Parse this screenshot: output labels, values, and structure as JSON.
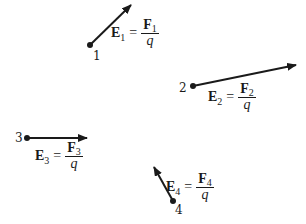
{
  "diagram": {
    "type": "electric-field-vectors",
    "colors": {
      "ink": "#1a1a1a",
      "background": "#ffffff"
    },
    "points": [
      {
        "id": "1",
        "label": "1",
        "position": [
          90,
          45
        ],
        "arrow_tip": [
          131,
          5
        ],
        "field_symbol": "E",
        "subscript": "1",
        "equals": "=",
        "force_symbol": "F",
        "denominator": "q"
      },
      {
        "id": "2",
        "label": "2",
        "position": [
          193,
          86
        ],
        "arrow_tip": [
          296,
          65
        ],
        "field_symbol": "E",
        "subscript": "2",
        "equals": "=",
        "force_symbol": "F",
        "denominator": "q"
      },
      {
        "id": "3",
        "label": "3",
        "position": [
          27,
          138
        ],
        "arrow_tip": [
          87,
          138
        ],
        "field_symbol": "E",
        "subscript": "3",
        "equals": "=",
        "force_symbol": "F",
        "denominator": "q"
      },
      {
        "id": "4",
        "label": "4",
        "position": [
          173,
          201
        ],
        "arrow_tip": [
          154,
          167
        ],
        "field_symbol": "E",
        "subscript": "4",
        "equals": "=",
        "force_symbol": "F",
        "denominator": "q"
      }
    ]
  }
}
